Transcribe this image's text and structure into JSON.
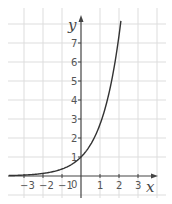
{
  "chart_data": {
    "type": "line",
    "title": "",
    "function": "y = e^x",
    "xlabel": "x",
    "ylabel": "y",
    "xlim": [
      -3.8,
      3.8
    ],
    "ylim": [
      -0.9,
      8.6
    ],
    "grid": true,
    "x_ticks": [
      "-3",
      "-2",
      "-1",
      "1",
      "2",
      "3"
    ],
    "y_ticks": [
      "1",
      "2",
      "3",
      "4",
      "5",
      "6",
      "7"
    ],
    "origin_label": "0",
    "series": [
      {
        "name": "exponential curve",
        "x": [
          -3.8,
          -3,
          -2,
          -1,
          0,
          0.5,
          1,
          1.5,
          2,
          2.1
        ],
        "y": [
          0.02,
          0.05,
          0.14,
          0.37,
          1,
          1.65,
          2.72,
          4.48,
          7.39,
          8.17
        ]
      }
    ]
  },
  "colors": {
    "curve": "#333333",
    "axis": "#444444",
    "grid": "#dddddd",
    "background": "#ffffff"
  },
  "labels": {
    "x_axis": "x",
    "y_axis": "y",
    "origin": "0"
  }
}
